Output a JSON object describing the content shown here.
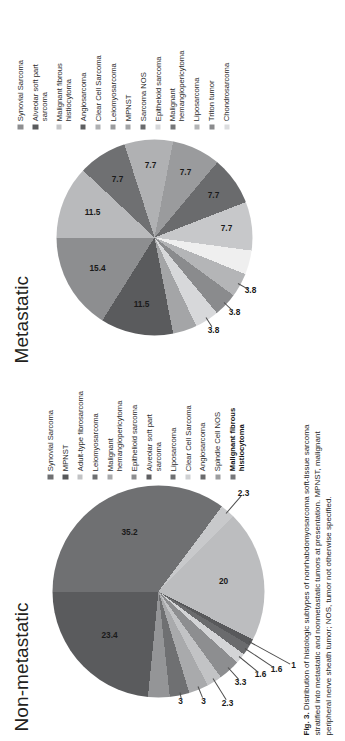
{
  "figure": {
    "caption_label": "Fig. 3.",
    "caption_text": "Distribution of histologic subtypes of nonrhabdomyosarcoma soft-tissue sarcoma stratified into metastatic and nonmetastatic tumors at presentation. MPNST, malignant peripheral nerve sheath tumor; NOS, tumor not otherwise specified."
  },
  "chart_data": [
    {
      "type": "pie",
      "title": "Non-metastatic",
      "panel": "left",
      "categories": [
        "Synovial Sarcoma",
        "MPNST",
        "Adult-type fibrosarcoma",
        "Leiomyosarcoma",
        "Malignant hemangiopericytoma",
        "Epithelioid sarcoma",
        "Alveolar soft part sarcoma",
        "Liposarcoma",
        "Clear Cell Sarcoma",
        "Angiosarcoma",
        "Spindle Cell NOS",
        "Malignant fibrous histiocytoma"
      ],
      "values": [
        35.2,
        23.4,
        3.3,
        3,
        3,
        2.3,
        1.6,
        1.6,
        1,
        20,
        2.3,
        3.3
      ],
      "labels_shown": [
        "35.2",
        "23.4",
        "3.3",
        "3",
        "3",
        "2.3",
        "1.6",
        "1.6",
        "1",
        "20",
        "2.3"
      ],
      "colors": [
        "#6f7072",
        "#5a5b5d",
        "#a9aaac",
        "#8d8e90",
        "#6f7072",
        "#c8c9cb",
        "#8d8e90",
        "#b9babc",
        "#58595b",
        "#bcbdbf",
        "#d9dadb",
        "#949597"
      ],
      "legend_position": "right",
      "legend": [
        {
          "label": "Synovial Sarcoma",
          "color": "#6f7072",
          "bold": false
        },
        {
          "label": "MPNST",
          "color": "#58595b",
          "bold": false
        },
        {
          "label": "Adult-type fibrosarcoma",
          "color": "#c2c3c5",
          "bold": false
        },
        {
          "label": "Leiomyosarcoma",
          "color": "#6f7072",
          "bold": false
        },
        {
          "label": "Malignant\nhemangiopericytoma",
          "color": "#a9aaac",
          "bold": false
        },
        {
          "label": "Epithelioid sarcoma",
          "color": "#8d8e90",
          "bold": false
        },
        {
          "label": "Alveolar soft part sarcoma",
          "color": "#5e5f61",
          "bold": false
        },
        {
          "label": "Liposarcoma",
          "color": "#6f7072",
          "bold": false
        },
        {
          "label": "Clear Cell Sarcoma",
          "color": "#d0d1d3",
          "bold": false
        },
        {
          "label": "Angiosarcoma",
          "color": "#6a6b6d",
          "bold": false
        },
        {
          "label": "Spindle Cell NOS",
          "color": "#9d9e a0",
          "bold": false
        },
        {
          "label": "Malignant fibrous histiocytoma",
          "color": "#76777a",
          "bold": true
        }
      ]
    },
    {
      "type": "pie",
      "title": "Metastatic",
      "panel": "right",
      "categories": [
        "Synovial Sarcoma",
        "Alveolar soft part sarcoma",
        "Malignant fibrous histiocytoma",
        "Angiosarcoma",
        "Clear Cell Sarcoma",
        "Leiomyosarcoma",
        "MPNST",
        "Sarcoma NOS",
        "Epithelioid sarcoma",
        "Malignant hemangiopericytoma",
        "Liposarcoma",
        "Triton tumor",
        "Chondrosarcoma"
      ],
      "values": [
        15.4,
        11.5,
        11.5,
        7.7,
        7.7,
        7.7,
        7.7,
        7.7,
        3.8,
        3.8,
        3.8,
        3.8,
        3.8
      ],
      "labels_shown": [
        "15.4",
        "11.5",
        "11.5",
        "7.7",
        "7.7",
        "7.7",
        "7.7",
        "7.7",
        "3.8",
        "3.8",
        "3.8"
      ],
      "colors": [
        "#8d8e90",
        "#5a5b5d",
        "#b9babc",
        "#6f7072",
        "#b0b1b3",
        "#87888a",
        "#a4a5a7",
        "#6a6b6d",
        "#c7c8ca",
        "#f0f0f0",
        "#b4b5b7",
        "#8a8b8d",
        "#d7d8da"
      ],
      "legend_position": "right",
      "legend": [
        {
          "label": "Synovial Sarcoma",
          "color": "#8d8e90",
          "bold": false
        },
        {
          "label": "Alveolar soft part sarcoma",
          "color": "#5a5b5d",
          "bold": false
        },
        {
          "label": "Malignant fibrous\nhistiocytoma",
          "color": "#c5c6c8",
          "bold": false
        },
        {
          "label": "Angiosarcoma",
          "color": "#5e5f61",
          "bold": false
        },
        {
          "label": "Clear Cell Sarcoma",
          "color": "#b0b1b3",
          "bold": false
        },
        {
          "label": "Leiomyosarcoma",
          "color": "#9a9b9d",
          "bold": false
        },
        {
          "label": "MPNST",
          "color": "#a4a5a7",
          "bold": false
        },
        {
          "label": "Sarcoma NOS",
          "color": "#6a6b6d",
          "bold": false
        },
        {
          "label": "Epitheloid sarcoma",
          "color": "#d7d8da",
          "bold": false
        },
        {
          "label": "Malignant\nhemangiopericytoma",
          "color": "#76777a",
          "bold": false
        },
        {
          "label": "Liposarcoma",
          "color": "#b4b5b7",
          "bold": false
        },
        {
          "label": "Triton tumor",
          "color": "#8a8b8d",
          "bold": false
        },
        {
          "label": "Chondrosarcoma",
          "color": "#dcdddf",
          "bold": false
        }
      ]
    }
  ]
}
